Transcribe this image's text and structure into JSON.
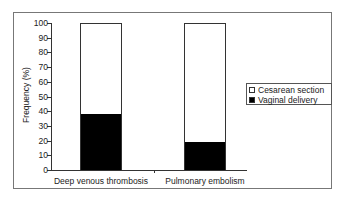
{
  "chart_data": {
    "type": "bar",
    "stacked": true,
    "title": "",
    "xlabel": "",
    "ylabel": "Frequency (%)",
    "ylim": [
      0,
      100
    ],
    "yticks": [
      0,
      10,
      20,
      30,
      40,
      50,
      60,
      70,
      80,
      90,
      100
    ],
    "categories": [
      "Deep venous thrombosis",
      "Pulmonary embolism"
    ],
    "series": [
      {
        "name": "Vaginal delivery",
        "color": "#000000",
        "values": [
          38,
          19
        ]
      },
      {
        "name": "Cesarean section",
        "color": "#ffffff",
        "values": [
          62,
          81
        ]
      }
    ],
    "legend": {
      "position": "right",
      "entries": [
        "Cesarean section",
        "Vaginal delivery"
      ]
    },
    "grid": false
  },
  "labels": {
    "ylabel": "Frequency (%)",
    "yticks": [
      "0",
      "10",
      "20",
      "30",
      "40",
      "50",
      "60",
      "70",
      "80",
      "90",
      "100"
    ],
    "cat0": "Deep venous thrombosis",
    "cat1": "Pulmonary embolism",
    "legend0": "Cesarean section",
    "legend1": "Vaginal delivery"
  }
}
